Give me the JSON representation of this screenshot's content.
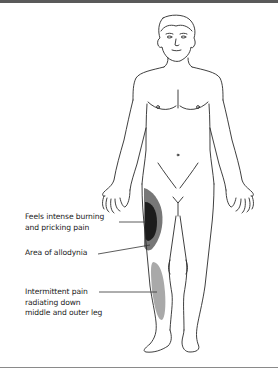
{
  "figure": {
    "colors": {
      "outline": "#2a2a2a",
      "intense_pain_region": "#1c1c1c",
      "allodynia_region": "#777777",
      "radiating_pain_region": "#a9a9a9",
      "top_bar": "#5a5a5a",
      "bottom_rule": "#8a8a8a"
    }
  },
  "annotations": [
    {
      "id": "burning",
      "lines": [
        "Feels intense burning",
        "and pricking pain"
      ],
      "target": "upper outer right thigh (dark region)"
    },
    {
      "id": "allodynia",
      "lines": [
        "Area of allodynia"
      ],
      "target": "grey halo around dark region"
    },
    {
      "id": "intermittent",
      "lines": [
        "Intermittent pain",
        "radiating down",
        "middle and outer leg"
      ],
      "target": "lower outer right leg (light grey region)"
    }
  ]
}
